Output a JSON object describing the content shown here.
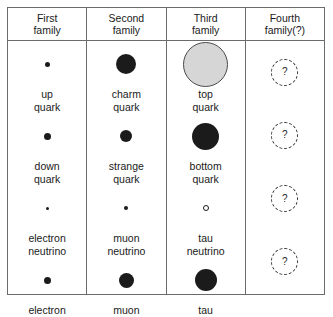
{
  "figure": {
    "columns": [
      {
        "id": "first",
        "line1": "First",
        "line2": "family"
      },
      {
        "id": "second",
        "line1": "Second",
        "line2": "family"
      },
      {
        "id": "third",
        "line1": "Third",
        "line2": "family"
      },
      {
        "id": "fourth",
        "line1": "Fourth",
        "line2": "family(?)"
      }
    ],
    "rows": [
      {
        "id": "up-type-quark",
        "cells": [
          {
            "column": "first",
            "name_line1": "up",
            "name_line2": "quark",
            "marker": "filled-dot",
            "size_px": 5,
            "fill": "#1b1b1b",
            "symbol": ""
          },
          {
            "column": "second",
            "name_line1": "charm",
            "name_line2": "quark",
            "marker": "filled-dot",
            "size_px": 20,
            "fill": "#1b1b1b",
            "symbol": ""
          },
          {
            "column": "third",
            "name_line1": "top",
            "name_line2": "quark",
            "marker": "gray-circle",
            "size_px": 45,
            "fill": "#d6d6d6",
            "symbol": ""
          },
          {
            "column": "fourth",
            "name_line1": "",
            "name_line2": "",
            "marker": "dashed-circle",
            "size_px": 27,
            "fill": "none",
            "symbol": "?"
          }
        ]
      },
      {
        "id": "down-type-quark",
        "cells": [
          {
            "column": "first",
            "name_line1": "down",
            "name_line2": "quark",
            "marker": "filled-dot",
            "size_px": 7,
            "fill": "#1b1b1b",
            "symbol": ""
          },
          {
            "column": "second",
            "name_line1": "strange",
            "name_line2": "quark",
            "marker": "filled-dot",
            "size_px": 12,
            "fill": "#1b1b1b",
            "symbol": ""
          },
          {
            "column": "third",
            "name_line1": "bottom",
            "name_line2": "quark",
            "marker": "filled-dot",
            "size_px": 27,
            "fill": "#1b1b1b",
            "symbol": ""
          },
          {
            "column": "fourth",
            "name_line1": "",
            "name_line2": "",
            "marker": "dashed-circle",
            "size_px": 27,
            "fill": "none",
            "symbol": "?"
          }
        ]
      },
      {
        "id": "neutrino",
        "cells": [
          {
            "column": "first",
            "name_line1": "electron",
            "name_line2": "neutrino",
            "marker": "filled-dot",
            "size_px": 3,
            "fill": "#1b1b1b",
            "symbol": ""
          },
          {
            "column": "second",
            "name_line1": "muon",
            "name_line2": "neutrino",
            "marker": "filled-dot",
            "size_px": 4,
            "fill": "#1b1b1b",
            "symbol": ""
          },
          {
            "column": "third",
            "name_line1": "tau",
            "name_line2": "neutrino",
            "marker": "hollow-circle",
            "size_px": 6,
            "fill": "#ffffff",
            "symbol": ""
          },
          {
            "column": "fourth",
            "name_line1": "",
            "name_line2": "",
            "marker": "dashed-circle",
            "size_px": 27,
            "fill": "none",
            "symbol": "?"
          }
        ]
      },
      {
        "id": "charged-lepton",
        "cells": [
          {
            "column": "first",
            "name_line1": "electron",
            "name_line2": "",
            "marker": "filled-dot",
            "size_px": 7,
            "fill": "#1b1b1b",
            "symbol": ""
          },
          {
            "column": "second",
            "name_line1": "muon",
            "name_line2": "",
            "marker": "filled-dot",
            "size_px": 15,
            "fill": "#1b1b1b",
            "symbol": ""
          },
          {
            "column": "third",
            "name_line1": "tau",
            "name_line2": "",
            "marker": "filled-dot",
            "size_px": 22,
            "fill": "#1b1b1b",
            "symbol": ""
          },
          {
            "column": "fourth",
            "name_line1": "",
            "name_line2": "",
            "marker": "dashed-circle",
            "size_px": 27,
            "fill": "none",
            "symbol": "?"
          }
        ]
      }
    ],
    "colors": {
      "border": "#6b6b6b",
      "text": "#1a1a1a",
      "marker_fill": "#1b1b1b",
      "top_quark_fill": "#d6d6d6",
      "background": "#ffffff"
    }
  }
}
